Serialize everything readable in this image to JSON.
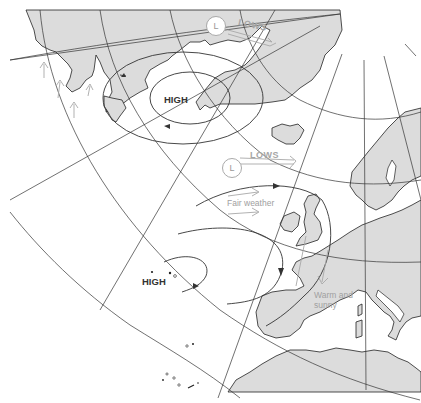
{
  "map": {
    "type": "weather pressure systems map",
    "region": "North Atlantic and Western Europe",
    "colors": {
      "land": "#dcdcdc",
      "sea": "#ffffff",
      "lines": "#333333",
      "annotation": "#a6a6a6"
    },
    "labels": {
      "high_north": "HIGH",
      "high_south": "HIGH",
      "lows_north": "LOWS",
      "lows_mid": "LOWS",
      "low_symbol_mid": "L",
      "low_symbol_north": "L",
      "fair_weather": "Fair weather",
      "warm_sunny_line1": "Warm and",
      "warm_sunny_line2": "sunny"
    }
  }
}
